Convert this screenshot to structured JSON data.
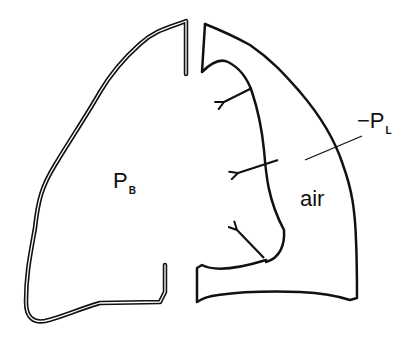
{
  "figure": {
    "colors": {
      "stroke": "#111111",
      "background": "#ffffff"
    },
    "labels": {
      "left_lung_pressure": {
        "main": "P",
        "subscript": "B"
      },
      "transpulmonary_pressure": {
        "prefix": "−",
        "main": "P",
        "subscript": "L"
      },
      "pleural_space": "air"
    },
    "arrows": {
      "count": 3,
      "direction": "inward (lung recoil)"
    }
  }
}
